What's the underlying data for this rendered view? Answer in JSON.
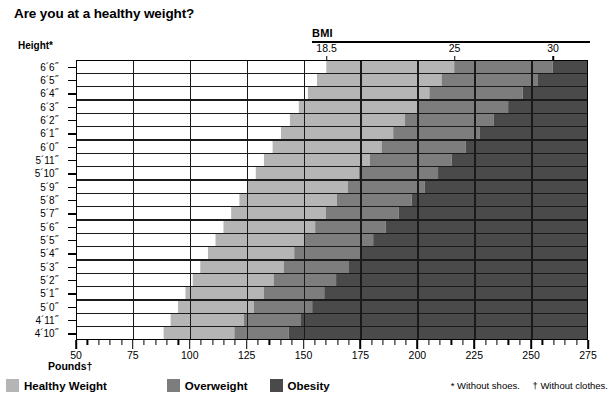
{
  "title": "Are you at a healthy weight?",
  "axes": {
    "y_title": "Height*",
    "x_title": "Pounds†",
    "bmi_title": "BMI",
    "bmi_ticks": [
      {
        "label": "18.5",
        "value": 18.5
      },
      {
        "label": "25",
        "value": 25
      },
      {
        "label": "30",
        "value": 30
      }
    ],
    "x_labels": [
      "50",
      "75",
      "100",
      "125",
      "150",
      "175",
      "200",
      "225",
      "250",
      "275"
    ],
    "x_values": [
      50,
      75,
      100,
      125,
      150,
      175,
      200,
      225,
      250,
      275
    ],
    "x_min": 50,
    "x_max": 275,
    "x_minor_step": 5,
    "y_labels": [
      "6´6˝",
      "6´5˝",
      "6´4˝",
      "6´3˝",
      "6´2˝",
      "6´1˝",
      "6´0˝",
      "5´11˝",
      "5´10˝",
      "5´9˝",
      "5´8˝",
      "5´7˝",
      "5´6˝",
      "5´5˝",
      "5´4˝",
      "5´3˝",
      "5´2˝",
      "5´1˝",
      "5´0˝",
      "4´11˝",
      "4´10˝"
    ],
    "y_inches": [
      78,
      77,
      76,
      75,
      74,
      73,
      72,
      71,
      70,
      69,
      68,
      67,
      66,
      65,
      64,
      63,
      62,
      61,
      60,
      59,
      58
    ]
  },
  "legend": {
    "items": [
      {
        "label": "Healthy Weight",
        "color": "#b5b5b5"
      },
      {
        "label": "Overweight",
        "color": "#7d7d7d"
      },
      {
        "label": "Obesity",
        "color": "#4a4a4a"
      }
    ]
  },
  "footnotes": {
    "shoes": "* Without shoes.",
    "clothes": "† Without clothes."
  },
  "chart_data": {
    "type": "area",
    "title": "Are you at a healthy weight?",
    "xlabel": "Pounds†",
    "ylabel": "Height*",
    "xlim": [
      50,
      275
    ],
    "ylim_inches": [
      58,
      78
    ],
    "grid": true,
    "legend_position": "bottom-left",
    "bands": [
      {
        "name": "Healthy Weight",
        "bmi_min": 18.5,
        "bmi_max": 25,
        "color": "#b5b5b5"
      },
      {
        "name": "Overweight",
        "bmi_min": 25,
        "bmi_max": 30,
        "color": "#7d7d7d"
      },
      {
        "name": "Obesity",
        "bmi_min": 30,
        "bmi_max": null,
        "color": "#4a4a4a"
      }
    ],
    "boundary_weights_lbs": {
      "note": "weight = BMI * height_inches^2 / 703",
      "bmi_18_5": [
        160.0,
        155.9,
        151.9,
        147.9,
        144.0,
        140.1,
        136.4,
        132.6,
        129.0,
        125.4,
        121.8,
        118.2,
        114.8,
        111.3,
        108.0,
        104.6,
        101.3,
        98.1,
        94.8,
        91.6,
        88.5
      ],
      "bmi_25": [
        216.2,
        210.7,
        205.3,
        199.9,
        194.6,
        189.4,
        184.3,
        179.2,
        174.3,
        169.4,
        164.6,
        159.8,
        155.1,
        150.5,
        145.9,
        141.4,
        136.9,
        132.5,
        128.2,
        123.8,
        119.6
      ],
      "bmi_30": [
        259.5,
        252.8,
        246.3,
        239.9,
        233.5,
        227.3,
        221.2,
        215.1,
        209.1,
        203.3,
        197.5,
        191.8,
        186.1,
        180.6,
        175.1,
        169.7,
        164.3,
        159.1,
        153.8,
        148.6,
        143.5
      ]
    }
  }
}
